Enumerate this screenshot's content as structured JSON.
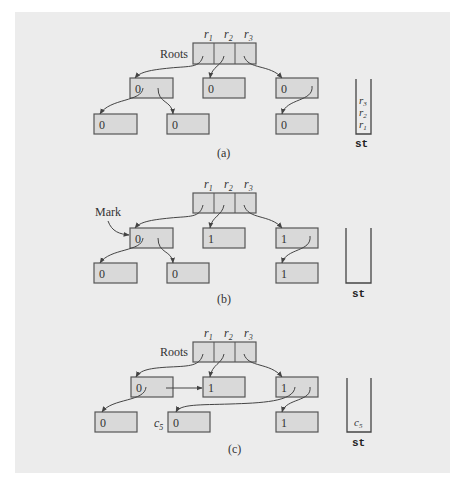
{
  "figure": {
    "panels": [
      {
        "id": "a",
        "caption": "(a)",
        "roots_label": "Roots",
        "root_cells": [
          "r1",
          "r2",
          "r3"
        ],
        "root_labels": [
          {
            "base": "r",
            "sub": "1"
          },
          {
            "base": "r",
            "sub": "2"
          },
          {
            "base": "r",
            "sub": "3"
          }
        ],
        "nodes": [
          {
            "id": "A",
            "mark": "0"
          },
          {
            "id": "B",
            "mark": "0"
          },
          {
            "id": "C",
            "mark": "0"
          },
          {
            "id": "D",
            "mark": "0"
          },
          {
            "id": "E",
            "mark": "0"
          },
          {
            "id": "F",
            "mark": "0"
          }
        ],
        "stack_label": "st",
        "stack_contents": [
          {
            "base": "r",
            "sub": "3"
          },
          {
            "base": "r",
            "sub": "2"
          },
          {
            "base": "r",
            "sub": "1"
          }
        ]
      },
      {
        "id": "b",
        "caption": "(b)",
        "annotation": "Mark",
        "root_labels": [
          {
            "base": "r",
            "sub": "1"
          },
          {
            "base": "r",
            "sub": "2"
          },
          {
            "base": "r",
            "sub": "3"
          }
        ],
        "nodes": [
          {
            "id": "A",
            "mark": "0"
          },
          {
            "id": "B",
            "mark": "1"
          },
          {
            "id": "C",
            "mark": "1"
          },
          {
            "id": "D",
            "mark": "0"
          },
          {
            "id": "E",
            "mark": "0"
          },
          {
            "id": "F",
            "mark": "1"
          }
        ],
        "stack_label": "st",
        "stack_contents": []
      },
      {
        "id": "c",
        "caption": "(c)",
        "roots_label": "Roots",
        "root_labels": [
          {
            "base": "r",
            "sub": "1"
          },
          {
            "base": "r",
            "sub": "2"
          },
          {
            "base": "r",
            "sub": "3"
          }
        ],
        "nodes": [
          {
            "id": "A",
            "mark": "0"
          },
          {
            "id": "B",
            "mark": "1"
          },
          {
            "id": "C",
            "mark": "1"
          },
          {
            "id": "D",
            "mark": "0"
          },
          {
            "id": "E",
            "mark": "0",
            "label": {
              "base": "c",
              "sub": "5"
            }
          },
          {
            "id": "F",
            "mark": "1"
          }
        ],
        "stack_label": "st",
        "stack_contents": [
          {
            "base": "c",
            "sub": "5"
          }
        ]
      }
    ],
    "colors": {
      "panel_bg": "#ececec",
      "node_fill": "#d9d9d9",
      "stroke": "#555555"
    }
  }
}
